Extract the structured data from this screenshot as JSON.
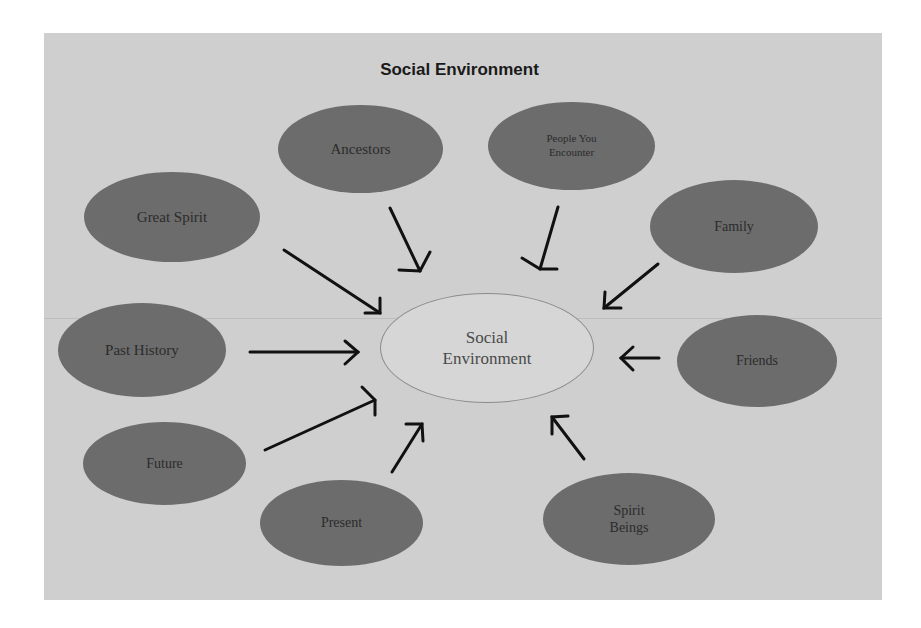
{
  "diagram": {
    "title": "Social Environment",
    "center_node": {
      "line1": "Social",
      "line2": "Environment"
    },
    "nodes": [
      {
        "id": "ancestors",
        "label": "Ancestors"
      },
      {
        "id": "people-you-encounter",
        "line1": "People You",
        "line2": "Encounter"
      },
      {
        "id": "great-spirit",
        "label": "Great Spirit"
      },
      {
        "id": "family",
        "label": "Family"
      },
      {
        "id": "past-history",
        "label": "Past History"
      },
      {
        "id": "friends",
        "label": "Friends"
      },
      {
        "id": "future",
        "label": "Future"
      },
      {
        "id": "present",
        "label": "Present"
      },
      {
        "id": "spirit-beings",
        "line1": "Spirit",
        "line2": "Beings"
      }
    ],
    "edges": [
      {
        "from": "ancestors",
        "to": "social-environment"
      },
      {
        "from": "people-you-encounter",
        "to": "social-environment"
      },
      {
        "from": "great-spirit",
        "to": "social-environment"
      },
      {
        "from": "family",
        "to": "social-environment"
      },
      {
        "from": "past-history",
        "to": "social-environment"
      },
      {
        "from": "friends",
        "to": "social-environment"
      },
      {
        "from": "future",
        "to": "social-environment"
      },
      {
        "from": "present",
        "to": "social-environment"
      },
      {
        "from": "spirit-beings",
        "to": "social-environment"
      }
    ],
    "colors": {
      "background": "#cfcfcf",
      "node_fill": "#6c6c6c",
      "center_fill": "#d6d6d6",
      "arrow": "#111111"
    }
  }
}
